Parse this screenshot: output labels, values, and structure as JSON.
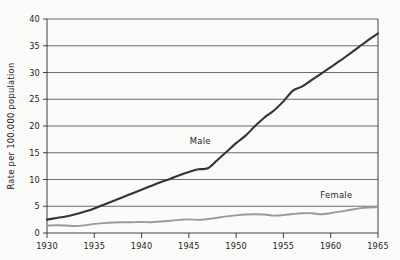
{
  "chart_data": {
    "type": "line",
    "title": "",
    "xlabel": "",
    "ylabel": "Rate per 100.000 population",
    "xlim": [
      1930,
      1965
    ],
    "ylim": [
      0,
      40
    ],
    "grid": "horizontal",
    "legend_position": "inline-annotations",
    "x_ticks": [
      "1930",
      "1935",
      "1940",
      "1945",
      "1950",
      "1955",
      "1960",
      "1965"
    ],
    "x_tick_values": [
      1930,
      1935,
      1940,
      1945,
      1950,
      1955,
      1960,
      1965
    ],
    "y_ticks": [
      "0",
      "5",
      "10",
      "15",
      "20",
      "25",
      "30",
      "35",
      "40"
    ],
    "y_tick_values": [
      0,
      5,
      10,
      15,
      20,
      25,
      30,
      35,
      40
    ],
    "x": [
      1930,
      1931,
      1932,
      1933,
      1934,
      1935,
      1936,
      1937,
      1938,
      1939,
      1940,
      1941,
      1942,
      1943,
      1944,
      1945,
      1946,
      1947,
      1948,
      1949,
      1950,
      1951,
      1952,
      1953,
      1954,
      1955,
      1956,
      1957,
      1958,
      1959,
      1960,
      1961,
      1962,
      1963,
      1964,
      1965
    ],
    "series": [
      {
        "name": "Male",
        "color": "#333333",
        "label_x": 1946.2,
        "label_y": 16.6,
        "values": [
          2.5,
          2.8,
          3.1,
          3.5,
          4.0,
          4.6,
          5.3,
          6.0,
          6.7,
          7.4,
          8.1,
          8.8,
          9.5,
          10.1,
          10.8,
          11.4,
          11.9,
          12.1,
          13.6,
          15.2,
          16.8,
          18.2,
          20.0,
          21.6,
          22.9,
          24.6,
          26.6,
          27.4,
          28.6,
          29.8,
          31.0,
          32.2,
          33.5,
          34.8,
          36.1,
          37.3
        ]
      },
      {
        "name": "Female",
        "color": "#9a9a9a",
        "label_x": 1960.6,
        "label_y": 6.6,
        "values": [
          1.4,
          1.45,
          1.4,
          1.3,
          1.45,
          1.7,
          1.85,
          1.95,
          2.0,
          2.0,
          2.05,
          2.0,
          2.15,
          2.3,
          2.45,
          2.55,
          2.45,
          2.6,
          2.85,
          3.1,
          3.3,
          3.45,
          3.5,
          3.45,
          3.25,
          3.35,
          3.55,
          3.7,
          3.7,
          3.5,
          3.7,
          4.0,
          4.3,
          4.6,
          4.75,
          4.8
        ]
      }
    ]
  },
  "axes": {
    "y_axis_label": "Rate per 100.000 population"
  }
}
